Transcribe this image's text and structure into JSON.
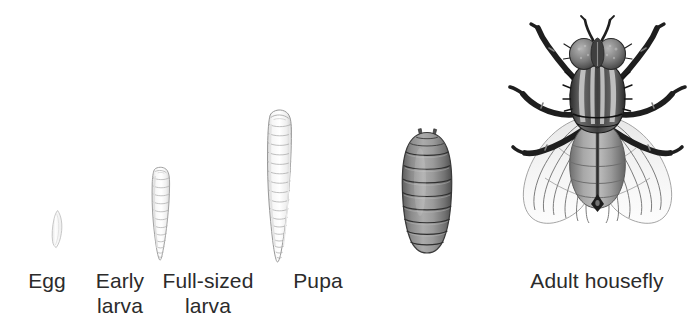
{
  "figure": {
    "background_color": "#ffffff",
    "label_color": "#2b2b2b",
    "style": "grayscale scientific line illustration"
  },
  "stages": [
    {
      "id": "egg",
      "label": "Egg",
      "icon": "housefly-egg-icon",
      "order": 1,
      "description": "small pale curved capsule",
      "fill_color": "#fbfbfb",
      "outline_color": "#b9b9b9",
      "label_lines": [
        "Egg"
      ],
      "label_center_x": 47,
      "label_top": 268,
      "art": {
        "x": 44,
        "y": 206,
        "width": 30,
        "height": 48
      }
    },
    {
      "id": "early-larva",
      "label": "Early larva",
      "icon": "housefly-early-larva-icon",
      "order": 2,
      "description": "small segmented pale maggot, blunt top tapering to a point",
      "fill_color": "#fafafa",
      "outline_color": "#a8a8a8",
      "segments": 14,
      "label_lines": [
        "Early",
        "larva"
      ],
      "label_center_x": 120,
      "label_top": 268,
      "art": {
        "x": 138,
        "y": 162,
        "width": 46,
        "height": 104
      }
    },
    {
      "id": "full-sized-larva",
      "label": "Full-sized larva",
      "icon": "housefly-full-sized-larva-icon",
      "order": 3,
      "description": "large segmented pale maggot, blunt rounded top tapering to a point",
      "fill_color": "#fafafa",
      "outline_color": "#a8a8a8",
      "segments": 18,
      "label_lines": [
        "Full-sized",
        "larva"
      ],
      "label_center_x": 208,
      "label_top": 268,
      "art": {
        "x": 252,
        "y": 104,
        "width": 56,
        "height": 162
      }
    },
    {
      "id": "pupa",
      "label": "Pupa",
      "icon": "housefly-pupa-icon",
      "order": 4,
      "description": "dark gray barrel-shaped puparium with banded segments and two small prongs on top",
      "fill_color": "#8e8e8e",
      "outline_color": "#3f3f3f",
      "segments": 9,
      "label_lines": [
        "Pupa"
      ],
      "label_center_x": 318,
      "label_top": 268,
      "art": {
        "x": 396,
        "y": 124,
        "width": 62,
        "height": 132
      }
    },
    {
      "id": "adult-housefly",
      "label": "Adult housefly",
      "icon": "housefly-adult-icon",
      "order": 5,
      "description": "dorsal view adult fly with large compound eyes, striped thorax, banded abdomen, two translucent veined wings and six dark legs",
      "fill_color": "#6f6f6f",
      "outline_color": "#1f1f1f",
      "wing_color": "#f2f2f2",
      "leg_count": 6,
      "wing_count": 2,
      "thorax_stripes": 4,
      "label_lines": [
        "Adult housefly"
      ],
      "label_center_x": 597,
      "label_top": 268,
      "art": {
        "x": 505,
        "y": 14,
        "width": 185,
        "height": 236
      }
    }
  ]
}
